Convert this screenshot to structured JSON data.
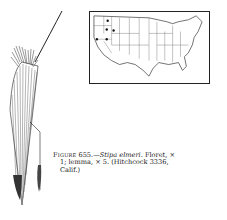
{
  "figure": {
    "label": "Figure",
    "number": "655.",
    "dash": "—",
    "species": "Stipa elmeri",
    "caption_line1_rest": ". Floret, ×",
    "caption_line2": "1; lemma, × 5. (Hitchcock 3336,",
    "caption_line3": "Calif.)"
  },
  "map": {
    "title": "United States distribution map",
    "dots": [
      {
        "x": 18,
        "y": 9
      },
      {
        "x": 17,
        "y": 18
      },
      {
        "x": 24,
        "y": 19
      },
      {
        "x": 7,
        "y": 28
      },
      {
        "x": 17,
        "y": 28
      }
    ]
  },
  "drawing": {
    "subject": "floret and lemma illustration"
  }
}
